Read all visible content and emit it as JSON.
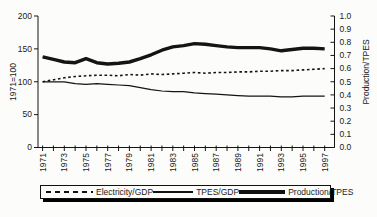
{
  "colors": {
    "line": "#141414",
    "text": "#1b1b1b",
    "background": "#fcfcfa",
    "legend_shadow": "#000000"
  },
  "chart_data": {
    "type": "line",
    "title": "",
    "grid": false,
    "x": [
      1971,
      1972,
      1973,
      1974,
      1975,
      1976,
      1977,
      1978,
      1979,
      1980,
      1981,
      1982,
      1983,
      1984,
      1985,
      1986,
      1987,
      1988,
      1989,
      1990,
      1991,
      1992,
      1993,
      1994,
      1995,
      1996,
      1997
    ],
    "x_tick_labels": [
      "1971",
      "1973",
      "1975",
      "1977",
      "1979",
      "1981",
      "1983",
      "1985",
      "1987",
      "1989",
      "1991",
      "1993",
      "1995",
      "1997"
    ],
    "left_axis": {
      "label": "1971=100",
      "min": 0,
      "max": 200,
      "ticks": [
        0,
        50,
        100,
        150,
        200
      ],
      "tick_labels": [
        "0",
        "50",
        "100",
        "150",
        "200"
      ]
    },
    "right_axis": {
      "label": "Production/TPES",
      "min": 0.0,
      "max": 1.0,
      "ticks": [
        0.0,
        0.1,
        0.2,
        0.3,
        0.4,
        0.5,
        0.6,
        0.7,
        0.8,
        0.9,
        1.0
      ],
      "tick_labels": [
        "0.0",
        "0.1",
        "0.2",
        "0.3",
        "0.4",
        "0.5",
        "0.6",
        "0.7",
        "0.8",
        "0.9",
        "1.0"
      ]
    },
    "series": [
      {
        "name": "Electricity/GDP",
        "axis": "left",
        "style": "dashed",
        "values": [
          100,
          103,
          106,
          108,
          109,
          110,
          110,
          109,
          111,
          110,
          112,
          111,
          112,
          113,
          114,
          113,
          114,
          114,
          115,
          115,
          116,
          116,
          117,
          117,
          118,
          119,
          120
        ]
      },
      {
        "name": "TPES/GDP",
        "axis": "left",
        "style": "thin",
        "values": [
          100,
          100,
          100,
          97,
          96,
          97,
          96,
          95,
          94,
          91,
          88,
          86,
          85,
          85,
          83,
          82,
          81,
          80,
          79,
          78,
          78,
          78,
          77,
          77,
          78,
          78,
          78
        ]
      },
      {
        "name": "Production/TPES",
        "axis": "right",
        "style": "thick",
        "values": [
          0.69,
          0.67,
          0.65,
          0.645,
          0.675,
          0.645,
          0.635,
          0.64,
          0.65,
          0.675,
          0.705,
          0.74,
          0.765,
          0.775,
          0.79,
          0.785,
          0.775,
          0.765,
          0.76,
          0.76,
          0.76,
          0.75,
          0.735,
          0.745,
          0.755,
          0.755,
          0.75
        ]
      }
    ],
    "legend": {
      "position": "bottom",
      "entries": [
        "Electricity/GDP",
        "TPES/GDP",
        "Production/TPES"
      ]
    }
  }
}
